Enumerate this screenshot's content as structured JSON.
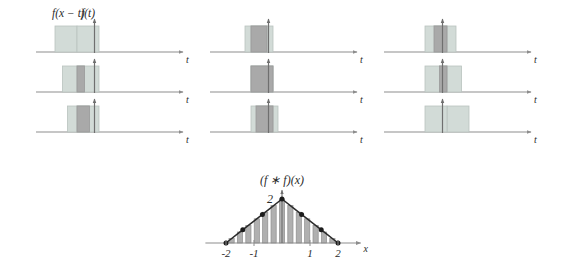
{
  "figure": {
    "kind": "convolution-illustration",
    "colors": {
      "background": "#ffffff",
      "rect_light": "#d2dbd7",
      "rect_light_stroke": "#b9c3bf",
      "rect_overlap": "#a9a9a9",
      "rect_overlap_stroke": "#9a9a9a",
      "axis": "#8d8d8d",
      "impulse_line": "#6f6f6f",
      "text": "#2b2b2b",
      "bar_fill": "#b0b0b0",
      "bar_stroke": "#8f8f8f",
      "curve": "#2b2b2b",
      "dot": "#1c1c1c"
    },
    "labels": {
      "sliding_function": "f(x − t)",
      "fixed_function": "f(t)",
      "convolution": "(f ∗ f)(x)",
      "axis_t": "t",
      "axis_x": "x",
      "peak_value": "2"
    },
    "panel_axis_label": "t",
    "panels": [
      {
        "id": "panel-col1-row1",
        "column": 1,
        "row": 1,
        "fixed_left": 39.0,
        "fixed_right": 61.0,
        "slide_left": 17.0,
        "slide_right": 39.0,
        "overlap_left": 39.0,
        "overlap_right": 39.0,
        "overlap_width": 0.0,
        "show_top_labels": true
      },
      {
        "id": "panel-col1-row2",
        "column": 1,
        "row": 2,
        "fixed_left": 39.0,
        "fixed_right": 61.0,
        "slide_left": 24.5,
        "slide_right": 46.5,
        "overlap_left": 39.0,
        "overlap_right": 46.5,
        "overlap_width": 7.5,
        "show_top_labels": false
      },
      {
        "id": "panel-col1-row3",
        "column": 1,
        "row": 3,
        "fixed_left": 39.0,
        "fixed_right": 61.0,
        "slide_left": 29.5,
        "slide_right": 51.5,
        "overlap_left": 39.0,
        "overlap_right": 51.5,
        "overlap_width": 12.5,
        "show_top_labels": false
      },
      {
        "id": "panel-col2-row1",
        "column": 2,
        "row": 1,
        "fixed_left": 39.0,
        "fixed_right": 61.0,
        "slide_left": 33.0,
        "slide_right": 55.0,
        "overlap_left": 39.0,
        "overlap_right": 55.0,
        "overlap_width": 16.0,
        "show_top_labels": false
      },
      {
        "id": "panel-col2-row2",
        "column": 2,
        "row": 2,
        "fixed_left": 39.0,
        "fixed_right": 61.0,
        "slide_left": 39.0,
        "slide_right": 61.0,
        "overlap_left": 39.0,
        "overlap_right": 61.0,
        "overlap_width": 22.0,
        "show_top_labels": false
      },
      {
        "id": "panel-col2-row3",
        "column": 2,
        "row": 3,
        "fixed_left": 39.0,
        "fixed_right": 61.0,
        "slide_left": 44.0,
        "slide_right": 66.0,
        "overlap_left": 44.0,
        "overlap_right": 61.0,
        "overlap_width": 17.0,
        "show_top_labels": false
      },
      {
        "id": "panel-col3-row1",
        "column": 3,
        "row": 1,
        "fixed_left": 39.0,
        "fixed_right": 61.0,
        "slide_left": 48.0,
        "slide_right": 70.0,
        "overlap_left": 48.0,
        "overlap_right": 61.0,
        "overlap_width": 13.0,
        "show_top_labels": false
      },
      {
        "id": "panel-col3-row2",
        "column": 3,
        "row": 2,
        "fixed_left": 39.0,
        "fixed_right": 61.0,
        "slide_left": 53.5,
        "slide_right": 75.5,
        "overlap_left": 53.5,
        "overlap_right": 61.0,
        "overlap_width": 7.5,
        "show_top_labels": false
      },
      {
        "id": "panel-col3-row3",
        "column": 3,
        "row": 3,
        "fixed_left": 39.0,
        "fixed_right": 61.0,
        "slide_left": 61.0,
        "slide_right": 83.0,
        "overlap_left": 61.0,
        "overlap_right": 61.0,
        "overlap_width": 0.0,
        "show_top_labels": false
      }
    ]
  },
  "chart_data": {
    "type": "line",
    "title": "(f ∗ f)(x)",
    "xlabel": "x",
    "ylabel": "",
    "xlim": [
      -2.45,
      2.45
    ],
    "ylim": [
      0,
      2.35
    ],
    "grid": false,
    "legend": "none",
    "xticks": [
      -2,
      -1,
      1,
      2
    ],
    "xtick_labels": [
      "-2",
      "-1",
      "1",
      "2"
    ],
    "yticks": [
      2
    ],
    "ytick_labels": [
      "2"
    ],
    "x": [
      -2,
      -1.6,
      -1.2,
      -0.8,
      -0.4,
      0,
      0.4,
      0.8,
      1.2,
      1.6,
      2
    ],
    "values": [
      0,
      0.4,
      0.8,
      1.2,
      1.6,
      2,
      1.6,
      1.2,
      0.8,
      0.4,
      0
    ],
    "bars": {
      "x": [
        -1.8,
        -1.5,
        -1.2,
        -0.9,
        -0.6,
        -0.3,
        0,
        0.3,
        0.6,
        0.9,
        1.2,
        1.5,
        1.8
      ],
      "values": [
        0.2,
        0.5,
        0.8,
        1.1,
        1.4,
        1.7,
        2.0,
        1.7,
        1.4,
        1.1,
        0.8,
        0.5,
        0.2
      ]
    },
    "markers": {
      "x": [
        -2,
        -1.4,
        -0.7,
        0,
        0.7,
        1.4,
        2
      ],
      "values": [
        0,
        0.6,
        1.3,
        2.0,
        1.3,
        0.6,
        0
      ]
    },
    "annotations": [
      "Triangular tent function; peak value 2 at x = 0; support [-2, 2]"
    ]
  }
}
